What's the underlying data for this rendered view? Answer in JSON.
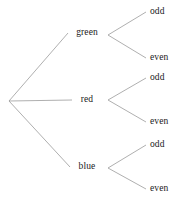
{
  "diagram": {
    "type": "tree",
    "title": "",
    "root": {
      "id": "root",
      "label": "",
      "x": 9,
      "y": 101
    },
    "edge_color": "#9a9a9a",
    "text_color": "#1a1a1a",
    "background": "#ffffff",
    "branches": [
      {
        "id": "green",
        "label": "green",
        "x": 87,
        "y": 33,
        "vertex_x": 108,
        "vertex_y": 35,
        "line_end_x": 68,
        "leaves": [
          {
            "id": "green-odd",
            "label": "odd",
            "x": 150,
            "y": 12
          },
          {
            "id": "green-even",
            "label": "even",
            "x": 150,
            "y": 58
          }
        ]
      },
      {
        "id": "red",
        "label": "red",
        "x": 87,
        "y": 100,
        "vertex_x": 108,
        "vertex_y": 100,
        "line_end_x": 72,
        "leaves": [
          {
            "id": "red-odd",
            "label": "odd",
            "x": 150,
            "y": 78
          },
          {
            "id": "red-even",
            "label": "even",
            "x": 150,
            "y": 122
          }
        ]
      },
      {
        "id": "blue",
        "label": "blue",
        "x": 87,
        "y": 167,
        "vertex_x": 108,
        "vertex_y": 168,
        "line_end_x": 70,
        "leaves": [
          {
            "id": "blue-odd",
            "label": "odd",
            "x": 150,
            "y": 145
          },
          {
            "id": "blue-even",
            "label": "even",
            "x": 150,
            "y": 189
          }
        ]
      }
    ]
  }
}
